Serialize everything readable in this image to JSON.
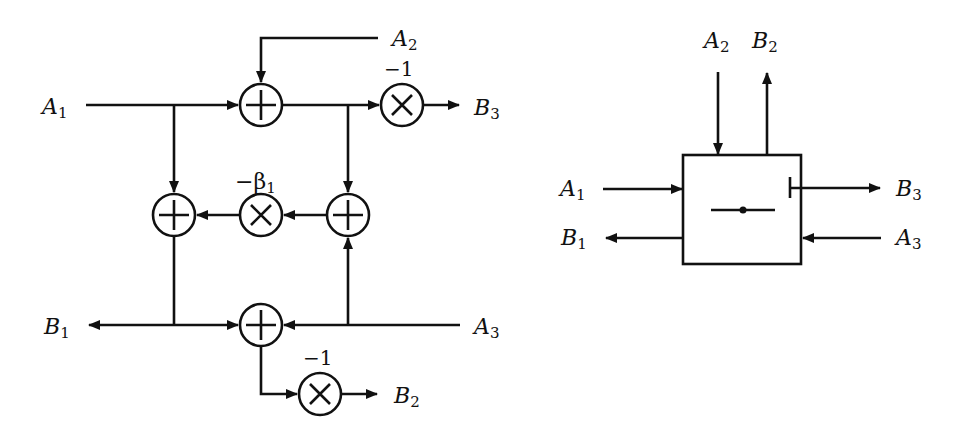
{
  "figure": {
    "left_diagram": {
      "description": "Signal flow graph of a three-port scattering junction",
      "inputs": [
        {
          "name": "A",
          "sub": "1"
        },
        {
          "name": "A",
          "sub": "2"
        },
        {
          "name": "A",
          "sub": "3"
        }
      ],
      "outputs": [
        {
          "name": "B",
          "sub": "1"
        },
        {
          "name": "B",
          "sub": "2"
        },
        {
          "name": "B",
          "sub": "3"
        }
      ],
      "labels": {
        "a1": {
          "name": "A",
          "sub": "1"
        },
        "a2": {
          "name": "A",
          "sub": "2"
        },
        "a3": {
          "name": "A",
          "sub": "3"
        },
        "b1": {
          "name": "B",
          "sub": "1"
        },
        "b2": {
          "name": "B",
          "sub": "2"
        },
        "b3": {
          "name": "B",
          "sub": "3"
        }
      },
      "multipliers": {
        "top_gain": "−1",
        "middle_gain_prefix": "−β",
        "middle_gain_sub": "1",
        "bottom_gain": "−1"
      },
      "nodes": [
        {
          "id": "adder-top",
          "type": "adder",
          "symbol": "+"
        },
        {
          "id": "mult-top",
          "type": "multiplier",
          "symbol": "×",
          "gain": "−1"
        },
        {
          "id": "adder-mid-left",
          "type": "adder",
          "symbol": "+"
        },
        {
          "id": "mult-mid",
          "type": "multiplier",
          "symbol": "×",
          "gain": "−β1"
        },
        {
          "id": "adder-mid-right",
          "type": "adder",
          "symbol": "+"
        },
        {
          "id": "adder-bottom",
          "type": "adder",
          "symbol": "+"
        },
        {
          "id": "mult-bottom",
          "type": "multiplier",
          "symbol": "×",
          "gain": "−1"
        }
      ]
    },
    "right_diagram": {
      "description": "Block symbol of the three-port junction",
      "labels": {
        "a1": {
          "name": "A",
          "sub": "1"
        },
        "a2": {
          "name": "A",
          "sub": "2"
        },
        "a3": {
          "name": "A",
          "sub": "3"
        },
        "b1": {
          "name": "B",
          "sub": "1"
        },
        "b2": {
          "name": "B",
          "sub": "2"
        },
        "b3": {
          "name": "B",
          "sub": "3"
        }
      }
    }
  }
}
